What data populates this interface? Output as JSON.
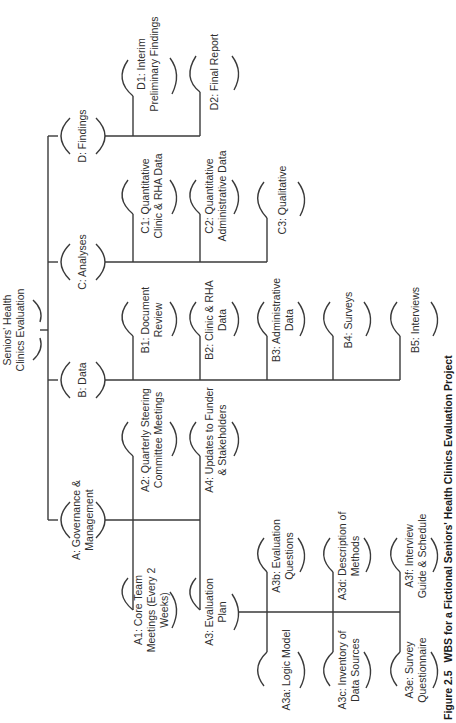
{
  "diagram": {
    "type": "work-breakdown-structure",
    "orientation": "rotated-90-ccw",
    "root": {
      "id": "root",
      "lines": [
        "Seniors' Health",
        "Clinics Evaluation"
      ]
    },
    "level1": [
      {
        "id": "A",
        "lines": [
          "A: Governance &",
          "Management"
        ]
      },
      {
        "id": "B",
        "lines": [
          "B: Data"
        ]
      },
      {
        "id": "C",
        "lines": [
          "C: Analyses"
        ]
      },
      {
        "id": "D",
        "lines": [
          "D: Findings"
        ]
      }
    ],
    "level2": {
      "A": [
        {
          "id": "A1",
          "lines": [
            "A1: Core Team",
            "Meetings (Every 2",
            "Weeks)"
          ]
        },
        {
          "id": "A2",
          "lines": [
            "A2: Quarterly Steering",
            "Committee Meetings"
          ]
        },
        {
          "id": "A3",
          "lines": [
            "A3: Evaluation",
            "Plan"
          ]
        },
        {
          "id": "A4",
          "lines": [
            "A4: Updates to Funder",
            "& Stakeholders"
          ]
        }
      ],
      "B": [
        {
          "id": "B1",
          "lines": [
            "B1: Document",
            "Review"
          ]
        },
        {
          "id": "B2",
          "lines": [
            "B2: Clinic & RHA",
            "Data"
          ]
        },
        {
          "id": "B3",
          "lines": [
            "B3: Administrative",
            "Data"
          ]
        },
        {
          "id": "B4",
          "lines": [
            "B4: Surveys"
          ]
        },
        {
          "id": "B5",
          "lines": [
            "B5: Interviews"
          ]
        }
      ],
      "C": [
        {
          "id": "C1",
          "lines": [
            "C1: Quantitative",
            "Clinic & RHA Data"
          ]
        },
        {
          "id": "C2",
          "lines": [
            "C2: Quantitative",
            "Administrative Data"
          ]
        },
        {
          "id": "C3",
          "lines": [
            "C3: Qualitative"
          ]
        }
      ],
      "D": [
        {
          "id": "D1",
          "lines": [
            "D1: Interim",
            "Preliminary Findings"
          ]
        },
        {
          "id": "D2",
          "lines": [
            "D2: Final Report"
          ]
        }
      ]
    },
    "level3": {
      "A3": [
        {
          "id": "A3a",
          "lines": [
            "A3a: Logic Model"
          ]
        },
        {
          "id": "A3b",
          "lines": [
            "A3b: Evaluation",
            "Questions"
          ]
        },
        {
          "id": "A3c",
          "lines": [
            "A3c: Inventory of",
            "Data Sources"
          ]
        },
        {
          "id": "A3d",
          "lines": [
            "A3d: Description of",
            "Methods"
          ]
        },
        {
          "id": "A3e",
          "lines": [
            "A3e: Survey",
            "Questionnaire"
          ]
        },
        {
          "id": "A3f",
          "lines": [
            "A3f: Interview",
            "Guide & Schedule"
          ]
        }
      ]
    }
  },
  "caption": {
    "figure_number": "Figure 2.5",
    "title": "WBS for a Fictional Seniors' Health Clinics Evaluation Project"
  }
}
